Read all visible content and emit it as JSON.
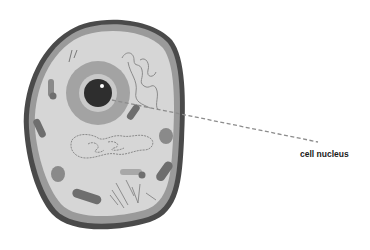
{
  "diagram": {
    "subject": "cell",
    "labels": [
      {
        "id": "cell-nucleus",
        "text": "cell nucleus",
        "x": 300,
        "y": 149
      }
    ],
    "leader_line": {
      "from": [
        112,
        100
      ],
      "to": [
        318,
        142
      ],
      "style": "dashed"
    },
    "colors": {
      "membrane": "#4a4a4a",
      "membrane_inner": "#9a9a9a",
      "cytoplasm": "#d6d6d6",
      "nucleus_ring": "#a3a3a3",
      "nucleus_inner": "#c9c9c9",
      "nucleolus": "#2e2e2e",
      "organelle_dark": "#6e6e6e",
      "organelle_mid": "#8a8a8a",
      "line": "#8c8c8c"
    }
  }
}
